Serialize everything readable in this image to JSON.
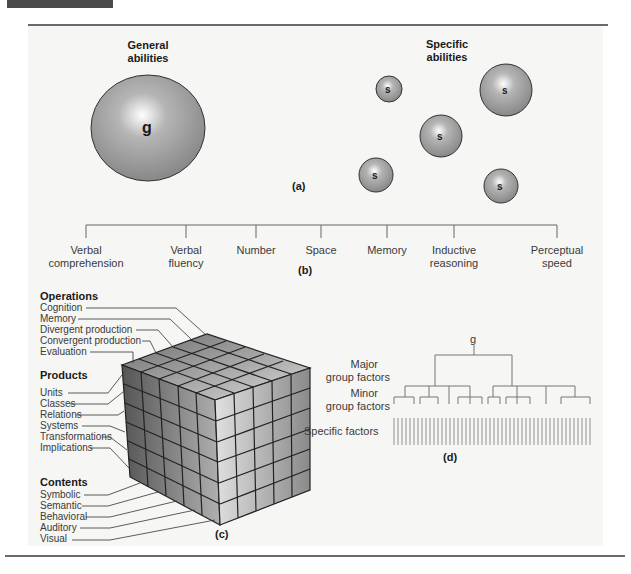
{
  "figure": {
    "panel_a": {
      "caption": "(a)",
      "general_title_line1": "General",
      "general_title_line2": "abilities",
      "general_factor": "g",
      "specific_title_line1": "Specific",
      "specific_title_line2": "abilities",
      "specific_factor": "s"
    },
    "panel_b": {
      "caption": "(b)",
      "abilities": [
        {
          "line1": "Verbal",
          "line2": "comprehension"
        },
        {
          "line1": "Verbal",
          "line2": "fluency"
        },
        {
          "line1": "Number",
          "line2": ""
        },
        {
          "line1": "Space",
          "line2": ""
        },
        {
          "line1": "Memory",
          "line2": ""
        },
        {
          "line1": "Inductive",
          "line2": "reasoning"
        },
        {
          "line1": "Perceptual",
          "line2": "speed"
        }
      ]
    },
    "panel_c": {
      "caption": "(c)",
      "operations_title": "Operations",
      "operations": [
        "Cognition",
        "Memory",
        "Divergent production",
        "Convergent production",
        "Evaluation"
      ],
      "products_title": "Products",
      "products": [
        "Units",
        "Classes",
        "Relations",
        "Systems",
        "Transformations",
        "Implications"
      ],
      "contents_title": "Contents",
      "contents": [
        "Symbolic",
        "Semantic",
        "Behavioral",
        "Auditory",
        "Visual"
      ]
    },
    "panel_d": {
      "caption": "(d)",
      "top": "g",
      "major_line1": "Major",
      "major_line2": "group factors",
      "minor_line1": "Minor",
      "minor_line2": "group factors",
      "specific": "Specific factors"
    }
  }
}
